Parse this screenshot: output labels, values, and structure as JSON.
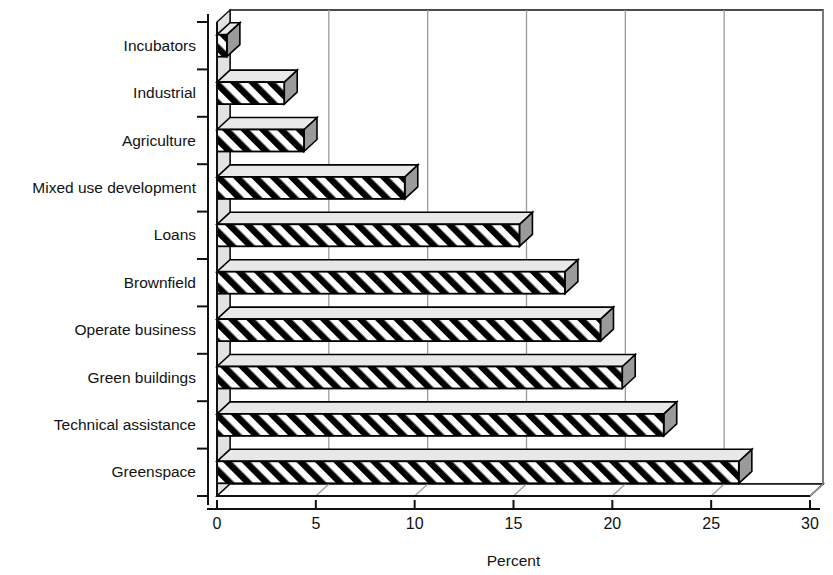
{
  "chart_data": {
    "type": "bar",
    "orientation": "horizontal",
    "title": "",
    "xlabel": "Percent",
    "ylabel": "",
    "xlim": [
      0,
      30
    ],
    "xticks": [
      0,
      5,
      10,
      15,
      20,
      25,
      30
    ],
    "xtick_labels": [
      "0",
      "5",
      "10",
      "15",
      "20",
      "25",
      "30"
    ],
    "grid": "vertical",
    "legend": "none",
    "style": "3d-hatched-bars",
    "categories": [
      "Incubators",
      "Industrial",
      "Agriculture",
      "Mixed use development",
      "Loans",
      "Brownfield",
      "Operate business",
      "Green buildings",
      "Technical assistance",
      "Greenspace"
    ],
    "values": [
      0.5,
      3.4,
      4.4,
      9.5,
      15.3,
      17.6,
      19.4,
      20.5,
      22.6,
      26.4
    ],
    "colors": {
      "bar_fill": "#ffffff",
      "bar_hatch": "#000000",
      "bar_top_face": "#e8e8e8",
      "bar_side_face": "#9a9a9a",
      "axis": "#111111",
      "gridline": "#9b9b9b",
      "wall_left": "#e2e2e2",
      "wall_back": "#ffffff",
      "floor": "#ffffff"
    }
  }
}
